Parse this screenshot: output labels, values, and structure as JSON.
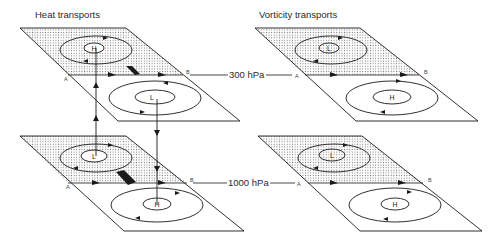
{
  "columns": [
    {
      "title": "Heat transports"
    },
    {
      "title": "Vorticity transports"
    }
  ],
  "levels": [
    {
      "label": "300 hPa"
    },
    {
      "label": "1000 hPa"
    }
  ],
  "points": {
    "a": "A",
    "b": "B"
  },
  "panels": [
    {
      "id": "heat-300",
      "shaded_center": "H",
      "clear_center": "L"
    },
    {
      "id": "vort-300",
      "shaded_center": "L",
      "clear_center": "H"
    },
    {
      "id": "heat-1000",
      "shaded_center": "L",
      "clear_center": "H"
    },
    {
      "id": "vort-1000",
      "shaded_center": "L",
      "clear_center": "H"
    }
  ],
  "colors": {
    "line": "#1a1a1a",
    "dots": "#8a8a8a",
    "background": "#ffffff"
  }
}
